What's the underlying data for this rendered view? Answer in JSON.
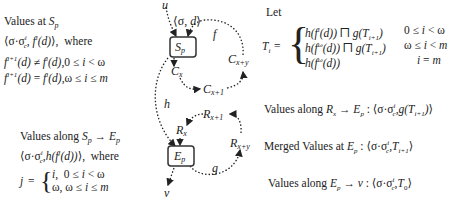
{
  "left_top": {
    "title": "Values at S_p",
    "line1": "⟨σ·σᶜⁱ, fⁱ(d)⟩,  where",
    "line2": "fⁱ⁺¹(d) ≠ fⁱ(d), 0 ≤ i < ω",
    "line3": "fⁱ⁺¹(d) = fⁱ(d), ω ≤ i ≤ m"
  },
  "left_bottom": {
    "title": "Values along S_p → E_p",
    "line1": "⟨σ·σᶜⁱ, h(fʲ(d))⟩,  where",
    "j_label": "j =",
    "case1": "i,  0 ≤ i < ω",
    "case2": "ω, ω ≤ i ≤ m"
  },
  "diagram": {
    "nodes": {
      "sp": "S_p",
      "ep": "E_p"
    },
    "labels": {
      "u": "u",
      "v": "v",
      "init": "⟨σ, d⟩",
      "f": "f",
      "g": "g",
      "h": "h",
      "cx": "Cₓ",
      "cx1": "Cₓ₊₁",
      "cxy": "Cₓ₊ᵧ",
      "rx": "Rₓ",
      "rx1": "Rₓ₊₁",
      "rxy": "Rₓ₊ᵧ"
    }
  },
  "right": {
    "let": "Let",
    "ti_label": "Tᵢ =",
    "cases": [
      {
        "expr": "h(fⁱ(d)) ⊓ g(Tᵢ₊₁)",
        "cond": "0 ≤ i < ω"
      },
      {
        "expr": "h(f^ω(d)) ⊓ g(Tᵢ₊₁)",
        "cond": "ω ≤ i < m"
      },
      {
        "expr": "h(f^ω(d))",
        "cond": "i = m"
      }
    ],
    "along_rx": "Values along Rₓ → E_p : ⟨σ·σᶜⁱ, g(Tᵢ₊₁)⟩",
    "merged": "Merged Values at E_p : ⟨σ·σᶜⁱ, Tᵢ₊₁⟩",
    "along_ep": "Values along E_p → v : ⟨σ·σᶜⁱ, T₀⟩"
  }
}
